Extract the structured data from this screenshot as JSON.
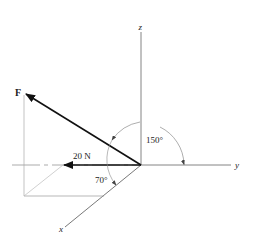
{
  "diagram": {
    "type": "3d-force-vector",
    "axes": {
      "x": {
        "label": "x"
      },
      "y": {
        "label": "y"
      },
      "z": {
        "label": "z"
      }
    },
    "force": {
      "label": "F",
      "component_label": "20 N"
    },
    "angles": {
      "angle_from_y": "150°",
      "angle_from_x": "70°"
    },
    "colors": {
      "axis": "#555555",
      "vector": "#111111",
      "construction": "#999999",
      "background": "#ffffff"
    }
  }
}
